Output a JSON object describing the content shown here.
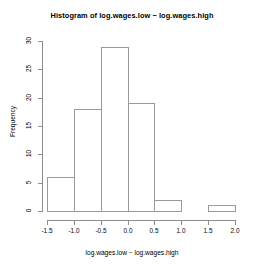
{
  "chart_data": {
    "type": "bar",
    "title": "Histogram of log.wages.low − log.wages.high",
    "xlabel": "log.wages.low − log.wages.high",
    "ylabel": "Frequency",
    "grid": false,
    "legend": null,
    "xlim": [
      -1.5,
      2.0
    ],
    "ylim": [
      0,
      30
    ],
    "bin_width": 0.5,
    "bin_edges": [
      -1.5,
      -1.0,
      -0.5,
      0.0,
      0.5,
      1.0,
      1.5,
      2.0
    ],
    "categories": [
      "-1.5 to -1.0",
      "-1.0 to -0.5",
      "-0.5 to 0.0",
      "0.0 to 0.5",
      "0.5 to 1.0",
      "1.0 to 1.5",
      "1.5 to 2.0"
    ],
    "values": [
      6,
      18,
      29,
      19,
      2,
      0,
      1
    ],
    "x_tick_labels": [
      "-1.5",
      "-1.0",
      "-0.5",
      "0.0",
      "0.5",
      "1.0",
      "1.5",
      "2.0"
    ],
    "x_tick_values": [
      -1.5,
      -1.0,
      -0.5,
      0.0,
      0.5,
      1.0,
      1.5,
      2.0
    ],
    "y_tick_labels": [
      "0",
      "5",
      "10",
      "15",
      "20",
      "25",
      "30"
    ],
    "y_tick_values": [
      0,
      5,
      10,
      15,
      20,
      25,
      30
    ],
    "colors": {
      "background": "#ffffff",
      "bar_border": "#9a9a9a",
      "bar_fill": "transparent",
      "axis": "#8d8d8d",
      "text": "#000000"
    }
  }
}
